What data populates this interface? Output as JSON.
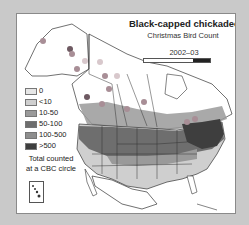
{
  "map": {
    "title": "Black-capped chickadee",
    "subtitle": "Christmas Bird Count",
    "season": "2002–03",
    "legend": {
      "items": [
        {
          "label": "0",
          "color": "#e6e6e6"
        },
        {
          "label": "<10",
          "color": "#cfcfcf"
        },
        {
          "label": "10-50",
          "color": "#9a9a9a"
        },
        {
          "label": "50-100",
          "color": "#6e6e6e"
        },
        {
          "label": "100-500",
          "color": "#8e8e8e"
        },
        {
          "label": ">500",
          "color": "#3e3e3e"
        }
      ],
      "note_line1": "Total counted",
      "note_line2": "at a CBC circle"
    },
    "colors": {
      "background": "#c9c9c9",
      "frame": "#ffffff",
      "border": "#8a8a8a",
      "dot_light": "#d8c8cc",
      "dot_mid": "#a88e96",
      "dot_dark": "#6e5a62"
    }
  }
}
